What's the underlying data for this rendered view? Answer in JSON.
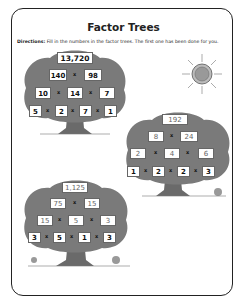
{
  "title": "Factor Trees",
  "directions": {
    "label": "Directions:",
    "text": " Fill in the numbers in the factor trees. The first one has been done for you."
  },
  "operator": "x",
  "colors": {
    "foliage": "#7a7a7a",
    "trunk": "#6a6a6a",
    "box": "#ffffff",
    "border": "#222222"
  },
  "trees": [
    {
      "top": "13,720",
      "row2": [
        "140",
        "98"
      ],
      "row3": [
        "10",
        "14",
        "7"
      ],
      "row4": [
        "5",
        "2",
        "7",
        "1"
      ]
    },
    {
      "top": "192",
      "row2": [
        "8",
        "24"
      ],
      "row3": [
        "2",
        "4",
        "6"
      ],
      "row4": [
        "1",
        "2",
        "2",
        "3"
      ]
    },
    {
      "top": "1,125",
      "row2": [
        "75",
        "15"
      ],
      "row3": [
        "15",
        "5",
        "3"
      ],
      "row4": [
        "3",
        "5",
        "1",
        "3"
      ]
    }
  ]
}
